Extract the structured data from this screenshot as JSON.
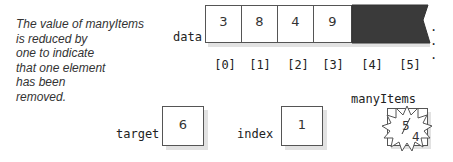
{
  "caption": {
    "lines": [
      "The value of manyItems",
      "is reduced by",
      "one to indicate",
      "that one element",
      "has been",
      "removed."
    ]
  },
  "array": {
    "label": "data",
    "cells": [
      "3",
      "8",
      "4",
      "9"
    ],
    "indices": [
      "[0]",
      "[1]",
      "[2]",
      "[3]",
      "[4]",
      "[5]"
    ],
    "unused_color": "#3a3a3a",
    "ellipsis": ". . ."
  },
  "target": {
    "label": "target",
    "value": "6"
  },
  "index": {
    "label": "index",
    "value": "1"
  },
  "manyItems": {
    "label": "manyItems",
    "old_value": "5",
    "new_value": "4"
  }
}
